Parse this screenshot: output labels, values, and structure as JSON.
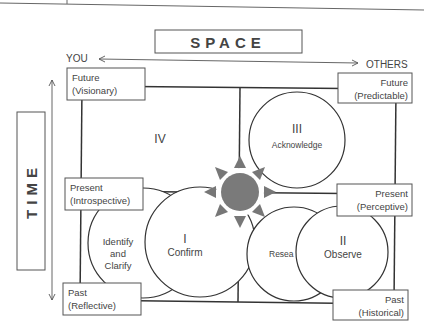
{
  "title": "SPACE",
  "axes": {
    "space": {
      "label": "SPACE",
      "left": "YOU",
      "right": "OTHERS"
    },
    "time": {
      "label": "TIME"
    }
  },
  "corner_labels": {
    "future_left": {
      "line1": "Future",
      "line2": "(Visionary)"
    },
    "future_right": {
      "line1": "Future",
      "line2": "(Predictable)"
    },
    "present_left": {
      "line1": "Present",
      "line2": "(Introspective)"
    },
    "present_right": {
      "line1": "Present",
      "line2": "(Perceptive)"
    },
    "past_left": {
      "line1": "Past",
      "line2": "(Reflective)"
    },
    "past_right": {
      "line1": "Past",
      "line2": "(Historical)"
    }
  },
  "quadrants": {
    "q1": {
      "numeral": "I",
      "label": "Confirm",
      "companion": {
        "line1": "Identify",
        "line2": "and",
        "line3": "Clarify"
      }
    },
    "q2": {
      "numeral": "II",
      "label": "Observe",
      "companion": {
        "label": "Resea"
      }
    },
    "q3": {
      "numeral": "III",
      "label": "Acknowledge"
    },
    "q4": {
      "numeral": "IV"
    }
  },
  "colors": {
    "sun": "#7a7a7a",
    "arrows": "#7a7a7a",
    "lines": "#333333"
  }
}
